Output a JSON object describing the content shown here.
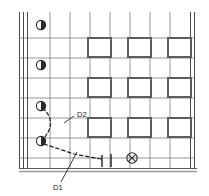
{
  "figure": {
    "type": "technical-line-drawing",
    "background_color": "#ffffff",
    "ink_color": "#3b3b3b",
    "grid_line_color": "#8a8a8a",
    "heavy_line_color": "#555555",
    "dash_color": "#1f1f1f",
    "label_color": "#1a1a1a"
  },
  "annotations": {
    "d1": {
      "text": "D1",
      "x": 57,
      "y": 188
    },
    "d2": {
      "text": "D2",
      "x": 77,
      "y": 117
    }
  },
  "icons": {
    "half_circle": {
      "name": "half-filled-circle-icon",
      "count": 4,
      "filled_side": "right",
      "radius": 4.6,
      "positions": [
        {
          "cx": 41,
          "cy": 25
        },
        {
          "cx": 41,
          "cy": 65
        },
        {
          "cx": 41,
          "cy": 106
        },
        {
          "cx": 41,
          "cy": 141
        }
      ]
    },
    "crossed_circle": {
      "name": "crossed-circle-icon",
      "cx": 132,
      "cy": 158,
      "radius": 5.2
    },
    "end_ticks": {
      "name": "measurement-end-tick",
      "positions": [
        {
          "x": 102,
          "y": 160
        },
        {
          "x": 111,
          "y": 159
        }
      ]
    }
  },
  "grid": {
    "vertical_lines_x": [
      19,
      23,
      27,
      50,
      70,
      90,
      110,
      130,
      150,
      170,
      190
    ],
    "horizontal_lines_y": [
      38,
      58,
      78,
      98,
      118,
      138,
      158
    ],
    "left_frame_x": [
      19,
      23,
      27
    ],
    "right_frame_x": [
      190,
      194
    ],
    "top_y": 12,
    "bottom_y": 168,
    "floor_y": 170
  },
  "windows": {
    "name": "window-opening",
    "count": 9,
    "width": 23,
    "height": 19,
    "columns_x": [
      88,
      128,
      168
    ],
    "rows_y": [
      38,
      78,
      118
    ]
  }
}
